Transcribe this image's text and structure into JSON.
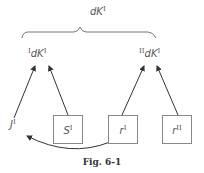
{
  "diagram": {
    "top": {
      "base": "dK",
      "sup": "I"
    },
    "left_node": {
      "pre": "I",
      "base": "dK",
      "sup": "I"
    },
    "right_node": {
      "pre": "II",
      "base": "dK",
      "sup": "I"
    },
    "bottom": {
      "j": {
        "base": "J",
        "sup": "I"
      },
      "s": {
        "base": "S",
        "sup": "I"
      },
      "r1": {
        "base": "r",
        "sup": "I"
      },
      "r2": {
        "base": "r",
        "sup": "II"
      }
    },
    "edges": [
      {
        "from": "J^I",
        "to": "I dK^I"
      },
      {
        "from": "S^I",
        "to": "I dK^I"
      },
      {
        "from": "r^I",
        "to": "II dK^I"
      },
      {
        "from": "r^II",
        "to": "II dK^I"
      },
      {
        "from": "r^I",
        "to": "J^I",
        "style": "curved"
      }
    ],
    "line_color": "#333333",
    "box_color": "#888888"
  },
  "caption": "Fig. 6-1"
}
